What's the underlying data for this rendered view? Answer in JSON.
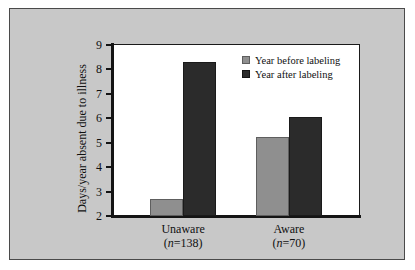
{
  "chart_data": {
    "type": "bar",
    "title": "",
    "xlabel": "",
    "ylabel": "Days/year absent due to illness",
    "ylim": [
      2,
      9
    ],
    "yticks": [
      2,
      3,
      4,
      5,
      6,
      7,
      8,
      9
    ],
    "ytick_labels": [
      "2",
      "3",
      "4",
      "5",
      "6",
      "7",
      "8",
      "9"
    ],
    "grid": false,
    "legend_position": "upper right",
    "categories": [
      "Unaware",
      "Aware"
    ],
    "category_sublabels": [
      "(n=138)",
      "(n=70)"
    ],
    "category_counts": [
      138,
      70
    ],
    "series": [
      {
        "name": "Year before labeling",
        "color": "#8f8f8f",
        "values": [
          2.7,
          5.25
        ]
      },
      {
        "name": "Year after labeling",
        "color": "#2b2b2b",
        "values": [
          8.3,
          6.05
        ]
      }
    ]
  },
  "figure": {
    "panel_background": "#c8c8c8",
    "plot_background": "#ffffff",
    "axis_color": "#141414",
    "border_color": "#4a4a4a"
  },
  "legend": {
    "items": [
      {
        "label": "Year before labeling",
        "swatch": "legend-swatch-before"
      },
      {
        "label": "Year after labeling",
        "swatch": "legend-swatch-after"
      }
    ]
  },
  "axis": {
    "y_title": "Days/year absent due to illness",
    "y_tick_labels": [
      "9",
      "8",
      "7",
      "6",
      "5",
      "4",
      "3",
      "2"
    ]
  },
  "categories": [
    {
      "name": "Unaware",
      "n_prefix": "(",
      "n_italic": "n",
      "n_suffix": "=138)"
    },
    {
      "name": "Aware",
      "n_prefix": "(",
      "n_italic": "n",
      "n_suffix": "=70)"
    }
  ]
}
